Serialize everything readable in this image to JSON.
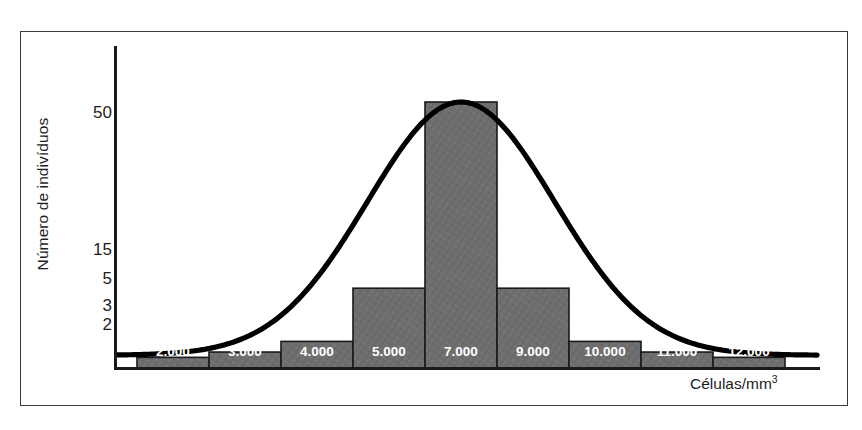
{
  "chart_data": {
    "type": "bar",
    "title": "",
    "subtitle": "",
    "xlabel": "Células/mm3",
    "xlabel_base": "Células/mm",
    "xlabel_exponent": "3",
    "ylabel": "Número de indivíduos",
    "categories": [
      "2.000",
      "3.000",
      "4.000",
      "5.000",
      "7.000",
      "9.000",
      "10.000",
      "11.000",
      "12.000"
    ],
    "values": [
      2,
      3,
      5,
      15,
      50,
      15,
      5,
      3,
      2
    ],
    "ytick_labels": [
      "50",
      "15",
      "5",
      "3",
      "2"
    ],
    "ytick_values": [
      50,
      15,
      5,
      3,
      2
    ],
    "ylim": [
      0,
      58
    ],
    "grid": false,
    "legend": false,
    "legend_position": "none",
    "bar_color": "#6e6e6e",
    "bar_edge_color": "#1a1a1a",
    "bar_label_color": "#ffffff",
    "curve_color": "#000000",
    "axis_color": "#1a1a1a",
    "frame_color": "#3a3a3a",
    "background_color": "#ffffff",
    "series": [
      {
        "name": "Número de indivíduos",
        "values": [
          2,
          3,
          5,
          15,
          50,
          15,
          5,
          3,
          2
        ]
      },
      {
        "name": "curva normal",
        "type": "line",
        "description": "curva de distribuição normal sobreposta ao histograma, com pico em 7.000"
      }
    ],
    "annotations": []
  }
}
